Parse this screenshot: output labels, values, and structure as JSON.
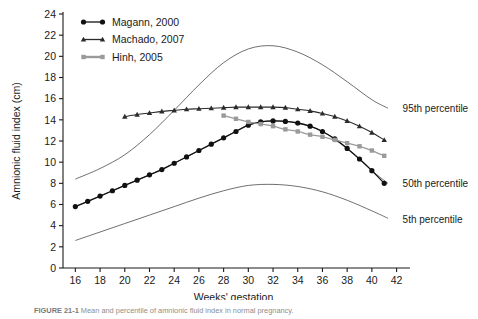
{
  "figure": {
    "caption_label": "FIGURE 21-1",
    "caption_text": "Mean and percentile of amnionic fluid index in normal pregnancy."
  },
  "chart_data": {
    "type": "line",
    "title": "",
    "xlabel": "Weeks' gestation",
    "ylabel": "Amnionic fluid index (cm)",
    "xlim": [
      15,
      42.6
    ],
    "ylim": [
      0,
      24
    ],
    "xticks": [
      16,
      18,
      20,
      22,
      24,
      26,
      28,
      30,
      32,
      34,
      36,
      38,
      40,
      42
    ],
    "xtick_labels": [
      "16",
      "18",
      "20",
      "22",
      "24",
      "26",
      "28",
      "30",
      "32",
      "34",
      "36",
      "38",
      "40",
      "42"
    ],
    "yticks": [
      0,
      2,
      4,
      6,
      8,
      10,
      12,
      14,
      16,
      18,
      20,
      22,
      24
    ],
    "ytick_labels": [
      "0",
      "2",
      "4",
      "6",
      "8",
      "10",
      "12",
      "14",
      "16",
      "18",
      "20",
      "22",
      "24"
    ],
    "grid": false,
    "legend_position": "top-left",
    "legend": [
      {
        "label": "Magann, 2000",
        "marker": "circle",
        "color": "#111111"
      },
      {
        "label": "Machado, 2007",
        "marker": "triangle",
        "color": "#2b2b2b"
      },
      {
        "label": "Hinh, 2005",
        "marker": "square",
        "color": "#9a9a9a"
      }
    ],
    "annotations": [
      {
        "text": "95th percentile",
        "x": 42.0,
        "y": 15.1
      },
      {
        "text": "50th percentile",
        "x": 42.0,
        "y": 8.0
      },
      {
        "text": "5th percentile",
        "x": 42.0,
        "y": 4.6
      }
    ],
    "series": [
      {
        "name": "Magann, 2000",
        "marker": "circle",
        "color": "#111111",
        "x": [
          16,
          17,
          18,
          19,
          20,
          21,
          22,
          23,
          24,
          25,
          26,
          27,
          28,
          29,
          30,
          31,
          32,
          33,
          34,
          35,
          36,
          37,
          38,
          39,
          40,
          41
        ],
        "values": [
          5.8,
          6.3,
          6.8,
          7.3,
          7.8,
          8.3,
          8.8,
          9.3,
          9.9,
          10.5,
          11.1,
          11.7,
          12.3,
          12.9,
          13.5,
          13.8,
          13.9,
          13.85,
          13.7,
          13.4,
          12.9,
          12.2,
          11.3,
          10.3,
          9.2,
          8.0
        ]
      },
      {
        "name": "Machado, 2007",
        "marker": "triangle",
        "color": "#2b2b2b",
        "x": [
          20,
          21,
          22,
          23,
          24,
          25,
          26,
          27,
          28,
          29,
          30,
          31,
          32,
          33,
          34,
          35,
          36,
          37,
          38,
          39,
          40,
          41
        ],
        "values": [
          14.3,
          14.5,
          14.65,
          14.8,
          14.9,
          15.0,
          15.05,
          15.1,
          15.15,
          15.2,
          15.2,
          15.2,
          15.2,
          15.15,
          15.0,
          14.85,
          14.6,
          14.3,
          13.9,
          13.4,
          12.8,
          12.1
        ]
      },
      {
        "name": "Hinh, 2005",
        "marker": "square",
        "color": "#9a9a9a",
        "x": [
          28,
          29,
          30,
          31,
          32,
          33,
          34,
          35,
          36,
          37,
          38,
          39,
          40,
          41
        ],
        "values": [
          14.4,
          14.1,
          13.8,
          13.6,
          13.4,
          13.1,
          12.9,
          12.6,
          12.4,
          12.1,
          11.8,
          11.5,
          11.1,
          10.6
        ]
      }
    ],
    "percentile_curves": [
      {
        "name": "95th percentile",
        "x": [
          16,
          18,
          20,
          22,
          24,
          26,
          28,
          30,
          32,
          34,
          36,
          38,
          40,
          41.3
        ],
        "values": [
          8.4,
          9.4,
          10.7,
          12.6,
          14.9,
          17.3,
          19.4,
          20.7,
          21.0,
          20.4,
          19.2,
          17.6,
          15.9,
          15.1
        ]
      },
      {
        "name": "50th percentile",
        "x": [
          16,
          18,
          20,
          22,
          24,
          26,
          28,
          30,
          32,
          34,
          36,
          38,
          40,
          41.3
        ],
        "values": [
          5.8,
          6.8,
          7.8,
          8.8,
          9.9,
          11.1,
          12.3,
          13.5,
          13.9,
          13.7,
          12.9,
          11.3,
          9.2,
          8.0
        ]
      },
      {
        "name": "5th percentile",
        "x": [
          16,
          18,
          20,
          22,
          24,
          26,
          28,
          30,
          32,
          34,
          36,
          38,
          40,
          41.3
        ],
        "values": [
          2.6,
          3.4,
          4.2,
          5.0,
          5.8,
          6.6,
          7.3,
          7.8,
          7.9,
          7.7,
          7.2,
          6.4,
          5.4,
          4.7
        ]
      }
    ]
  }
}
